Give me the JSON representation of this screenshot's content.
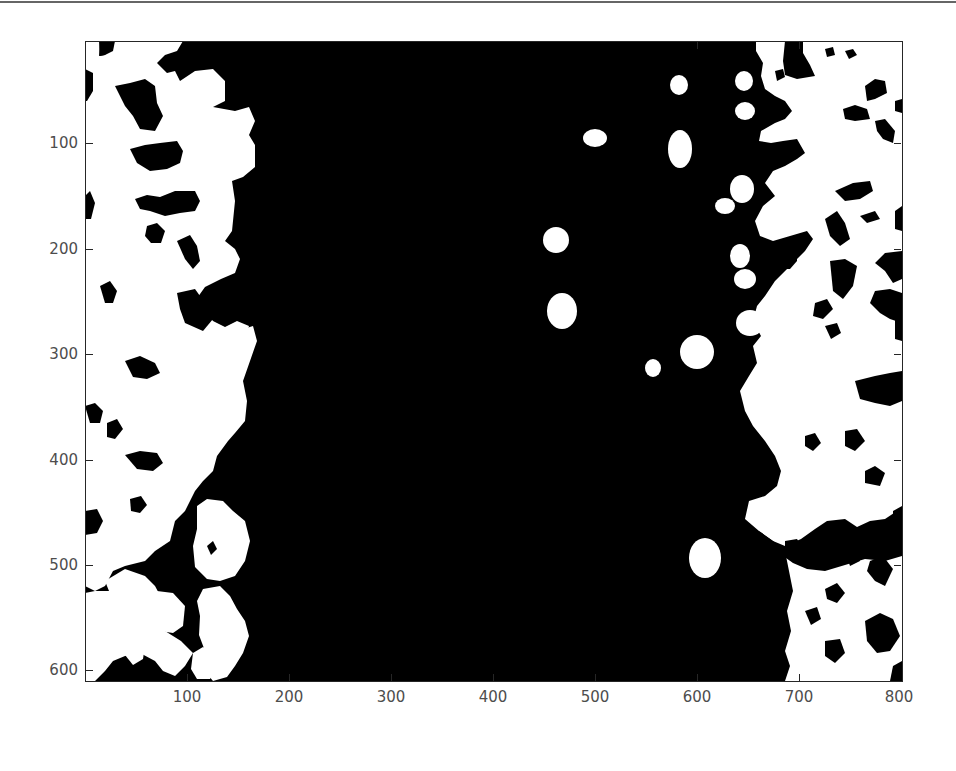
{
  "figure": {
    "type": "binary-image-display",
    "colormap": {
      "foreground": "#ffffff",
      "background": "#000000"
    },
    "axes_color": "#262626",
    "tick_label_color": "#4d4d4d"
  },
  "axes": {
    "x_ticks": [
      {
        "label": "100",
        "px": 187
      },
      {
        "label": "200",
        "px": 289
      },
      {
        "label": "300",
        "px": 391
      },
      {
        "label": "400",
        "px": 493
      },
      {
        "label": "500",
        "px": 595
      },
      {
        "label": "600",
        "px": 697
      },
      {
        "label": "700",
        "px": 799
      },
      {
        "label": "800",
        "px": 901
      }
    ],
    "y_ticks": [
      {
        "label": "100",
        "px": 143
      },
      {
        "label": "200",
        "px": 249
      },
      {
        "label": "300",
        "px": 354
      },
      {
        "label": "400",
        "px": 460
      },
      {
        "label": "500",
        "px": 565
      },
      {
        "label": "600",
        "px": 670
      }
    ],
    "x_range": [
      0.5,
      800.5
    ],
    "y_range": [
      0.5,
      607.5
    ]
  }
}
